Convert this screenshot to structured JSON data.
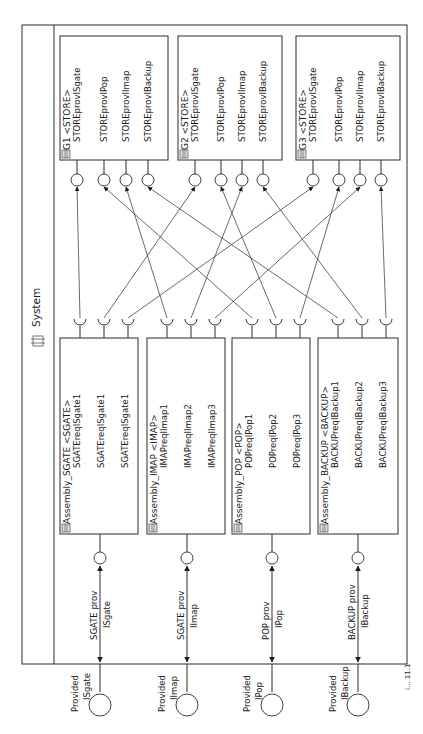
{
  "system": {
    "title": "System",
    "icon": "component-icon"
  },
  "stores": [
    {
      "id": "G1",
      "title": "G1 <STORE>",
      "ports": [
        "STOREprovISgate",
        "STOREprovIPop",
        "STOREprovIImap",
        "STOREprovIBackup"
      ]
    },
    {
      "id": "G2",
      "title": "G2 <STORE>",
      "ports": [
        "STOREprovISgate",
        "STOREprovIPop",
        "STOREprovIImap",
        "STOREprovIBackup"
      ]
    },
    {
      "id": "G3",
      "title": "G3 <STORE>",
      "ports": [
        "STOREprovISgate",
        "STOREprovIPop",
        "STOREprovIImap",
        "STOREprovIBackup"
      ]
    }
  ],
  "assemblies": [
    {
      "id": "SGATE",
      "title": "Assembly_SGATE <SGATE>",
      "ports": [
        "SGATEreqISgate1",
        "SGATEreqISgate1",
        "SGATEreqISgate1"
      ],
      "delegation_label": [
        "SGATE prov",
        "ISgate"
      ],
      "external_label": [
        "Provided",
        "ISgate"
      ]
    },
    {
      "id": "IMAP",
      "title": "Assembly_IMAP <IMAP>",
      "ports": [
        "IMAPreqIImap1",
        "IMAPreqIImap2",
        "IMAPreqIImap3"
      ],
      "delegation_label": [
        "SGATE prov",
        "IImap"
      ],
      "external_label": [
        "Provided",
        "IImap"
      ]
    },
    {
      "id": "POP",
      "title": "Assembly_POP <POP>",
      "ports": [
        "POPreqIPop1",
        "POPreqIPop2",
        "POPreqIPop3"
      ],
      "delegation_label": [
        "POP prov",
        "IPop"
      ],
      "external_label": [
        "Provided",
        "IPop"
      ]
    },
    {
      "id": "BACKUP",
      "title": "Assembly_BACKUP <BACKUP>",
      "ports": [
        "BACKUPreqIBackup1",
        "BACKUPreqIBackup2",
        "BACKUPreqIBackup3"
      ],
      "delegation_label": [
        "BACKUP prov",
        "IBackup"
      ],
      "external_label": [
        "Provided",
        "IBackup"
      ]
    }
  ],
  "connections": [
    {
      "from": [
        0,
        0
      ],
      "to": [
        0,
        0
      ]
    },
    {
      "from": [
        0,
        1
      ],
      "to": [
        1,
        0
      ]
    },
    {
      "from": [
        0,
        2
      ],
      "to": [
        2,
        0
      ]
    },
    {
      "from": [
        1,
        0
      ],
      "to": [
        0,
        2
      ]
    },
    {
      "from": [
        1,
        1
      ],
      "to": [
        1,
        2
      ]
    },
    {
      "from": [
        1,
        2
      ],
      "to": [
        2,
        2
      ]
    },
    {
      "from": [
        2,
        0
      ],
      "to": [
        0,
        1
      ]
    },
    {
      "from": [
        2,
        1
      ],
      "to": [
        1,
        1
      ]
    },
    {
      "from": [
        2,
        2
      ],
      "to": [
        2,
        1
      ]
    },
    {
      "from": [
        3,
        0
      ],
      "to": [
        0,
        3
      ]
    },
    {
      "from": [
        3,
        1
      ],
      "to": [
        1,
        3
      ]
    },
    {
      "from": [
        3,
        2
      ],
      "to": [
        2,
        3
      ]
    }
  ],
  "figure_caption_fragment": "i... 11.1"
}
